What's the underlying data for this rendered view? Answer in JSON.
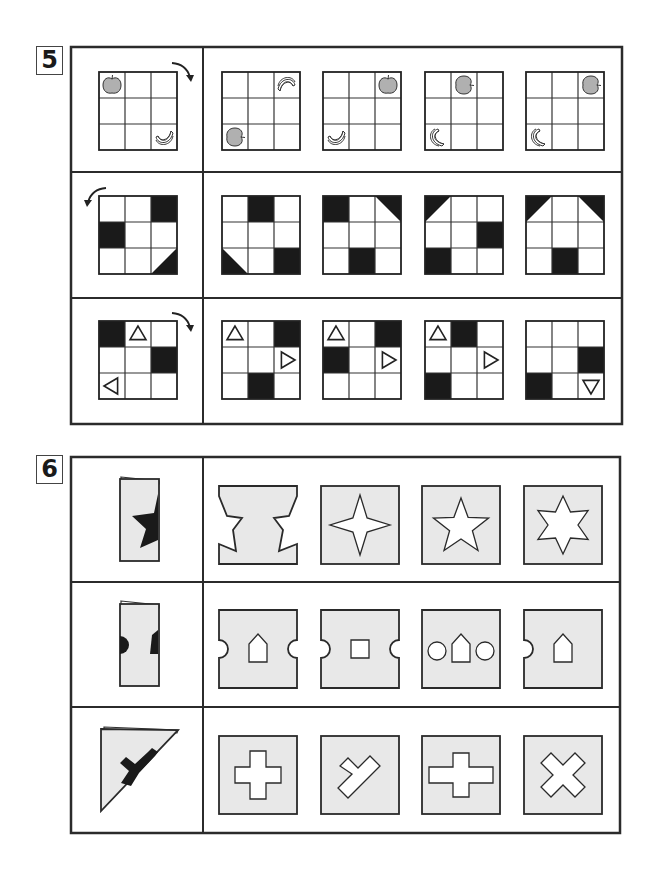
{
  "page": {
    "background": "#ffffff",
    "line_color": "#2b2b2b",
    "paper_fill": "#e8e8e8",
    "dark_fill": "#1a1a1a",
    "fruit_fill": "#b0b0b0"
  },
  "section5": {
    "number": "5",
    "rows": [
      {
        "name": "fruit-rotation",
        "rotation_arrow": "clockwise",
        "question": {
          "cells": [
            {
              "r": 0,
              "c": 0,
              "item": "apple"
            },
            {
              "r": 2,
              "c": 2,
              "item": "banana"
            }
          ]
        },
        "options": [
          {
            "cells": [
              {
                "r": 0,
                "c": 2,
                "item": "banana-rotated"
              },
              {
                "r": 2,
                "c": 0,
                "item": "apple-rotated"
              }
            ]
          },
          {
            "cells": [
              {
                "r": 0,
                "c": 2,
                "item": "apple"
              },
              {
                "r": 2,
                "c": 0,
                "item": "banana"
              }
            ]
          },
          {
            "cells": [
              {
                "r": 0,
                "c": 1,
                "item": "apple-rotated"
              },
              {
                "r": 2,
                "c": 0,
                "item": "banana-crescent"
              }
            ]
          },
          {
            "cells": [
              {
                "r": 0,
                "c": 2,
                "item": "apple-rotated"
              },
              {
                "r": 2,
                "c": 0,
                "item": "banana-crescent"
              }
            ]
          }
        ]
      },
      {
        "name": "black-square-rotation",
        "rotation_arrow": "counterclockwise",
        "question": {
          "cells": [
            {
              "r": 0,
              "c": 2,
              "fill": "full"
            },
            {
              "r": 1,
              "c": 0,
              "fill": "full"
            },
            {
              "r": 2,
              "c": 2,
              "fill": "tri-br"
            }
          ]
        },
        "options": [
          {
            "cells": [
              {
                "r": 0,
                "c": 1,
                "fill": "full"
              },
              {
                "r": 2,
                "c": 0,
                "fill": "tri-bl"
              },
              {
                "r": 2,
                "c": 2,
                "fill": "full"
              }
            ]
          },
          {
            "cells": [
              {
                "r": 0,
                "c": 0,
                "fill": "full"
              },
              {
                "r": 0,
                "c": 2,
                "fill": "tri-tr"
              },
              {
                "r": 2,
                "c": 1,
                "fill": "full"
              }
            ]
          },
          {
            "cells": [
              {
                "r": 0,
                "c": 0,
                "fill": "tri-tl"
              },
              {
                "r": 1,
                "c": 2,
                "fill": "full"
              },
              {
                "r": 2,
                "c": 0,
                "fill": "full"
              }
            ]
          },
          {
            "cells": [
              {
                "r": 0,
                "c": 0,
                "fill": "tri-tl"
              },
              {
                "r": 0,
                "c": 2,
                "fill": "tri-tr"
              },
              {
                "r": 2,
                "c": 1,
                "fill": "full"
              }
            ]
          }
        ]
      },
      {
        "name": "triangle-rotation",
        "rotation_arrow": "clockwise",
        "question": {
          "cells": [
            {
              "r": 0,
              "c": 0,
              "fill": "full"
            },
            {
              "r": 0,
              "c": 1,
              "tri": "up"
            },
            {
              "r": 1,
              "c": 2,
              "fill": "full"
            },
            {
              "r": 2,
              "c": 0,
              "tri": "left"
            }
          ]
        },
        "options": [
          {
            "cells": [
              {
                "r": 0,
                "c": 0,
                "tri": "up"
              },
              {
                "r": 0,
                "c": 2,
                "fill": "full"
              },
              {
                "r": 1,
                "c": 2,
                "tri": "right"
              },
              {
                "r": 2,
                "c": 1,
                "fill": "full"
              }
            ]
          },
          {
            "cells": [
              {
                "r": 0,
                "c": 0,
                "tri": "up"
              },
              {
                "r": 0,
                "c": 2,
                "fill": "full"
              },
              {
                "r": 1,
                "c": 0,
                "fill": "full"
              },
              {
                "r": 1,
                "c": 2,
                "tri": "right"
              }
            ]
          },
          {
            "cells": [
              {
                "r": 0,
                "c": 0,
                "tri": "up"
              },
              {
                "r": 0,
                "c": 1,
                "fill": "full"
              },
              {
                "r": 1,
                "c": 2,
                "tri": "right"
              },
              {
                "r": 2,
                "c": 0,
                "fill": "full"
              }
            ]
          },
          {
            "cells": [
              {
                "r": 1,
                "c": 2,
                "fill": "full"
              },
              {
                "r": 2,
                "c": 0,
                "fill": "full"
              },
              {
                "r": 2,
                "c": 2,
                "tri": "down"
              }
            ]
          }
        ]
      }
    ]
  },
  "section6": {
    "number": "6",
    "rows": [
      {
        "name": "folded-star",
        "question": "half-star on folded paper",
        "options": [
          "hourglass-notched",
          "four-point-star",
          "five-point-star",
          "six-point-star"
        ]
      },
      {
        "name": "folded-semicircle-house",
        "question": "semicircle and house-half on folded paper",
        "options": [
          "notches-and-house",
          "notches-and-square",
          "circles-and-house",
          "left-notch-and-house"
        ]
      },
      {
        "name": "folded-triangle-t",
        "question": "T shape on folded triangle",
        "options": [
          "plus",
          "diagonal-y",
          "wide-plus",
          "x-cross"
        ]
      }
    ]
  }
}
